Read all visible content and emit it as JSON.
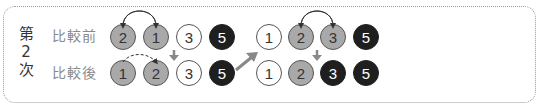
{
  "step": {
    "chars": [
      "第",
      "2",
      "次"
    ]
  },
  "rows": {
    "before_label": "比較前",
    "after_label": "比較後"
  },
  "left_group": {
    "before": [
      {
        "value": "2",
        "style": "gray"
      },
      {
        "value": "1",
        "style": "gray"
      },
      {
        "value": "3",
        "style": "white"
      },
      {
        "value": "5",
        "style": "dark"
      }
    ],
    "after": [
      {
        "value": "1",
        "style": "gray"
      },
      {
        "value": "2",
        "style": "gray"
      },
      {
        "value": "3",
        "style": "white"
      },
      {
        "value": "5",
        "style": "dark"
      }
    ]
  },
  "right_group": {
    "before": [
      {
        "value": "1",
        "style": "white"
      },
      {
        "value": "2",
        "style": "gray"
      },
      {
        "value": "3",
        "style": "gray"
      },
      {
        "value": "5",
        "style": "dark"
      }
    ],
    "after": [
      {
        "value": "1",
        "style": "white"
      },
      {
        "value": "2",
        "style": "gray"
      },
      {
        "value": "3",
        "style": "dark"
      },
      {
        "value": "5",
        "style": "dark"
      }
    ]
  },
  "colors": {
    "gray_fill": "#a9a9a9",
    "dark_fill": "#1f1f1f",
    "arrow": "#888888",
    "frame": "#9a9a9a"
  }
}
